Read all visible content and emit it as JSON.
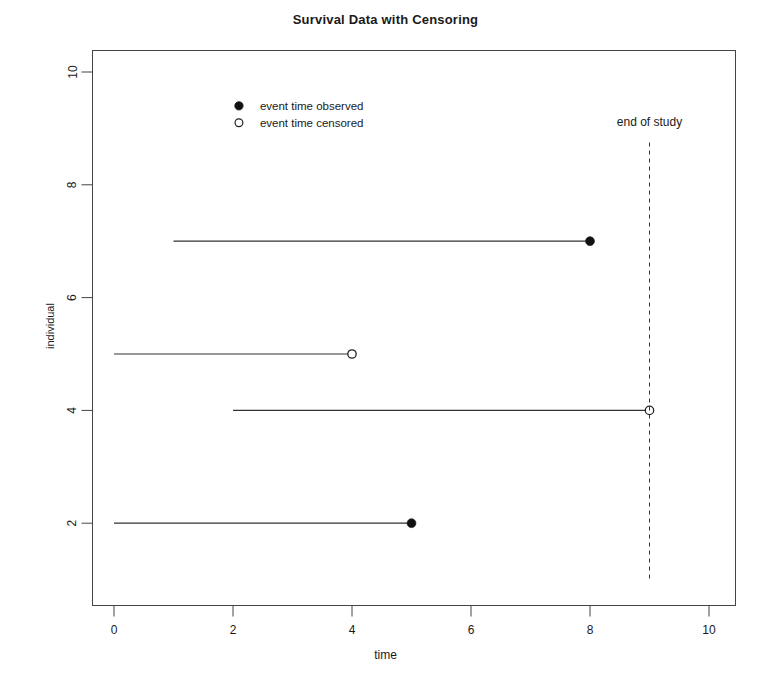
{
  "chart_data": {
    "type": "line",
    "title": "Survival Data with Censoring",
    "xlabel": "time",
    "ylabel": "individual",
    "xlim": [
      -0.3,
      10.3
    ],
    "ylim": [
      1.0,
      10.4
    ],
    "grid": false,
    "xticks": [
      "0",
      "2",
      "4",
      "6",
      "8",
      "10"
    ],
    "xtick_values": [
      0,
      2,
      4,
      6,
      8,
      10
    ],
    "yticks": [
      "2",
      "4",
      "6",
      "8",
      "10"
    ],
    "ytick_values": [
      2,
      4,
      6,
      8,
      10
    ],
    "series": [
      {
        "name": "individual-7",
        "individual": 7,
        "start": 1,
        "end": 8,
        "status": "observed",
        "marker": "filled-circle"
      },
      {
        "name": "individual-5",
        "individual": 5,
        "start": 0,
        "end": 4,
        "status": "censored",
        "marker": "open-circle"
      },
      {
        "name": "individual-4",
        "individual": 4,
        "start": 2,
        "end": 9,
        "status": "censored",
        "marker": "open-circle"
      },
      {
        "name": "individual-2",
        "individual": 2,
        "start": 0,
        "end": 5,
        "status": "observed",
        "marker": "filled-circle"
      }
    ],
    "annotations": [
      {
        "name": "end-of-study",
        "label": "end of study",
        "x": 9,
        "label_y": 9.05,
        "line_style": "dashed",
        "line_from_y": 1.0,
        "line_to_y": 8.75
      }
    ],
    "legend": {
      "position": "upper-left-inset",
      "x": 2.1,
      "y_observed": 9.4,
      "y_censored": 9.1,
      "entries": [
        {
          "label": "event time observed",
          "marker": "filled-circle"
        },
        {
          "label": "event time censored",
          "marker": "open-circle"
        }
      ]
    },
    "colors": {
      "background": "#ffffff",
      "foreground": "#1a1a1a",
      "line": "#333333",
      "marker_fill": "#111111",
      "marker_open_fill": "#ffffff",
      "box": "#444444"
    }
  }
}
